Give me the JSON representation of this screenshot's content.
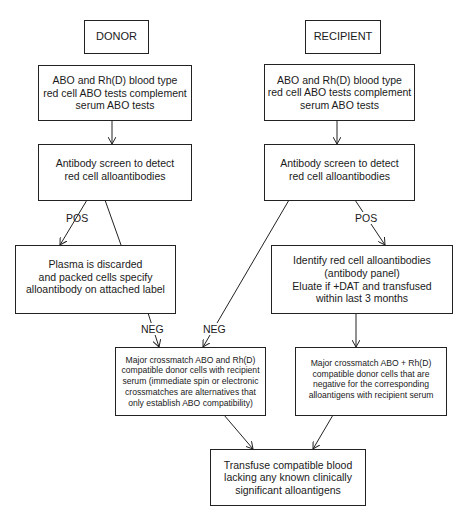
{
  "diagram": {
    "type": "flowchart",
    "nodes": {
      "donor": {
        "label": "DONOR"
      },
      "recipient": {
        "label": "RECIPIENT"
      },
      "donor_typing": {
        "label": "ABO and Rh(D) blood type\nred cell ABO tests complement\nserum ABO tests"
      },
      "recipient_typing": {
        "label": "ABO and Rh(D) blood type\nred cell ABO tests complement\nserum ABO tests"
      },
      "donor_screen": {
        "label": "Antibody screen to detect\nred cell alloantibodies"
      },
      "recipient_screen": {
        "label": "Antibody screen to detect\nred cell alloantibodies"
      },
      "plasma_discarded": {
        "label": "Plasma is discarded\nand packed cells specify\nalloantibody on attached label"
      },
      "identify_alloantibodies": {
        "label": "Identify red cell alloantibodies\n(antibody panel)\nEluate if +DAT and transfused\nwithin last 3 months"
      },
      "crossmatch_neg": {
        "label": "Major crossmatch ABO and Rh(D)\ncompatible donor cells with recipient\nserum (immediate spin or electronic\ncrossmatches are alternatives that\nonly establish ABO compatibility)"
      },
      "crossmatch_pos": {
        "label": "Major crossmatch ABO + Rh(D)\ncompatible donor cells that are\nnegative for the corresponding\nalloantigens with recipient serum"
      },
      "transfuse": {
        "label": "Transfuse compatible blood\nlacking any known clinically\nsignificant alloantigens"
      }
    },
    "edge_labels": {
      "donor_pos": "POS",
      "donor_neg": "NEG",
      "recipient_neg": "NEG",
      "recipient_pos": "POS"
    },
    "edges": [
      {
        "from": "donor",
        "to": "donor_typing",
        "label": ""
      },
      {
        "from": "donor_typing",
        "to": "donor_screen",
        "label": ""
      },
      {
        "from": "donor_screen",
        "to": "plasma_discarded",
        "label": "POS"
      },
      {
        "from": "donor_screen",
        "to": "crossmatch_neg",
        "label": "NEG"
      },
      {
        "from": "recipient",
        "to": "recipient_typing",
        "label": ""
      },
      {
        "from": "recipient_typing",
        "to": "recipient_screen",
        "label": ""
      },
      {
        "from": "recipient_screen",
        "to": "crossmatch_neg",
        "label": "NEG"
      },
      {
        "from": "recipient_screen",
        "to": "identify_alloantibodies",
        "label": "POS"
      },
      {
        "from": "identify_alloantibodies",
        "to": "crossmatch_pos",
        "label": ""
      },
      {
        "from": "crossmatch_neg",
        "to": "transfuse",
        "label": ""
      },
      {
        "from": "crossmatch_pos",
        "to": "transfuse",
        "label": ""
      }
    ]
  }
}
